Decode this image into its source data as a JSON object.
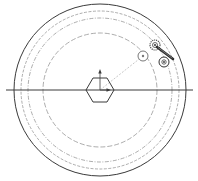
{
  "diagram": {
    "type": "mechanical-schematic",
    "colors": {
      "background": "#ffffff",
      "stroke_main": "#3a3a3a",
      "stroke_dashed": "#8a8a8a",
      "stroke_light": "#b0b0b0"
    },
    "center": {
      "x": 100,
      "y": 90
    },
    "outer_circle": {
      "r": 86
    },
    "tracks": [
      {
        "r": 79,
        "style": "dashed"
      },
      {
        "r": 72,
        "style": "dash-dot"
      },
      {
        "r": 57,
        "style": "dashed"
      }
    ],
    "horizontal_axis": {
      "x1": 6,
      "x2": 193,
      "y": 90
    },
    "hub": {
      "shape": "hexagon",
      "width": 28,
      "height": 24
    },
    "hub_axes": {
      "vertical_arrow": {
        "from_y": 90,
        "to_y": 72
      },
      "horizontal_arrow": {
        "from_x": 100,
        "to_x": 110
      }
    },
    "radial_line": {
      "from": [
        100,
        90
      ],
      "to": [
        143,
        56
      ],
      "style": "dashed"
    },
    "mechanism": {
      "idler_wheel": {
        "cx": 143,
        "cy": 56,
        "r": 5
      },
      "gear": {
        "cx": 155,
        "cy": 45,
        "r": 5
      },
      "drive_wheel": {
        "cx": 164,
        "cy": 62,
        "r": 5
      },
      "link_arm": {
        "x1": 157,
        "y1": 47,
        "x2": 173,
        "y2": 59
      }
    }
  }
}
